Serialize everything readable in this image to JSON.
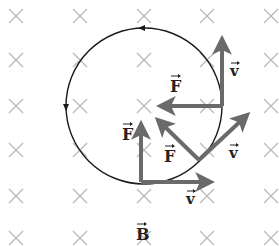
{
  "diagram": {
    "colors": {
      "background": "#ffffff",
      "field_marks": "#b8b8b8",
      "circle": "#1a1a1a",
      "vectors": "#6a6a6a",
      "labels": "#222222"
    },
    "field": {
      "symbol": "×",
      "direction": "into-page",
      "columns_x": [
        16,
        80,
        144,
        207,
        271
      ],
      "rows_y": [
        16,
        60,
        106,
        150,
        196,
        238
      ]
    },
    "orbit": {
      "cx": 144,
      "cy": 106,
      "r": 78,
      "direction": "counterclockwise"
    },
    "vector_pairs": [
      {
        "name": "bottom",
        "point": [
          141,
          182
        ],
        "force_tip": [
          141,
          127
        ],
        "velocity_tip": [
          208,
          182
        ],
        "force_label": "F",
        "velocity_label": "v",
        "force_label_pos": [
          122,
          140
        ],
        "velocity_label_pos": [
          186,
          204
        ]
      },
      {
        "name": "lower-right",
        "point": [
          199,
          160
        ],
        "force_tip": [
          160,
          122
        ],
        "velocity_tip": [
          245,
          117
        ],
        "force_label": "F",
        "velocity_label": "v",
        "force_label_pos": [
          164,
          162
        ],
        "velocity_label_pos": [
          229,
          158
        ]
      },
      {
        "name": "right",
        "point": [
          222,
          106
        ],
        "force_tip": [
          163,
          106
        ],
        "velocity_tip": [
          222,
          42
        ],
        "force_label": "F",
        "velocity_label": "v",
        "force_label_pos": [
          170,
          92
        ],
        "velocity_label_pos": [
          230,
          76
        ]
      }
    ],
    "field_label": {
      "text": "B",
      "pos": [
        136,
        240
      ]
    }
  }
}
